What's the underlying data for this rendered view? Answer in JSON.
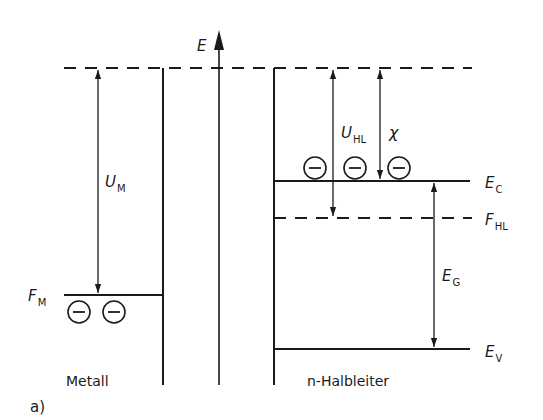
{
  "diagram": {
    "panel_label": "a)",
    "axis_label": "E",
    "regions": {
      "metal": "Metall",
      "semiconductor": "n-Halbleiter"
    },
    "levels": {
      "metal_fermi": {
        "main": "F",
        "sub": "M"
      },
      "conduction_band": {
        "main": "E",
        "sub": "C"
      },
      "semiconductor_fermi": {
        "main": "F",
        "sub": "HL"
      },
      "valence_band": {
        "main": "E",
        "sub": "V"
      }
    },
    "energies": {
      "metal_work_function": {
        "main": "U",
        "sub": "M"
      },
      "semiconductor_work_function": {
        "main": "U",
        "sub": "HL"
      },
      "electron_affinity": {
        "main": "χ"
      },
      "band_gap": {
        "main": "E",
        "sub": "G"
      }
    },
    "electron_symbol": "−",
    "colors": {
      "ink": "#1a1a1a",
      "background": "#ffffff"
    }
  }
}
